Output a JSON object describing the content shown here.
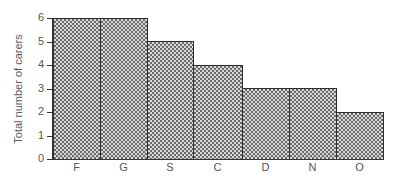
{
  "chart_data": {
    "type": "bar",
    "title": "",
    "xlabel": "",
    "ylabel": "Total number of carers",
    "categories": [
      "F",
      "G",
      "S",
      "C",
      "D",
      "N",
      "O"
    ],
    "values": [
      6,
      6,
      5,
      4,
      3,
      3,
      2
    ],
    "ylim": [
      0,
      6
    ],
    "yticks": [
      0,
      1,
      2,
      3,
      4,
      5,
      6
    ],
    "grid": false,
    "legend": null,
    "bar_style": "stippled gray fill with black outline, bars touching"
  },
  "layout": {
    "plot_left": 53,
    "plot_bottom": 159,
    "px_per_unit": 23.5,
    "bar_edges": [
      53,
      100,
      147,
      193,
      242,
      289,
      336,
      383
    ],
    "colors": {
      "axis": "#333333",
      "bar_border": "#2b2b2b",
      "bar_fill_dark": "#6a6a6a",
      "bar_fill_light": "#d8d8d8",
      "text": "#555555"
    }
  }
}
